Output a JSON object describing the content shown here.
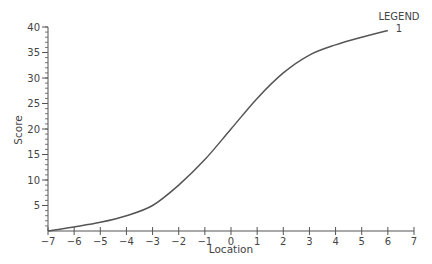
{
  "chart_data": {
    "type": "line",
    "title": "",
    "xlabel": "Location",
    "ylabel": "Score",
    "xlim": [
      -7,
      7
    ],
    "ylim": [
      0,
      40
    ],
    "xticks": [
      -7,
      -6,
      -5,
      -4,
      -3,
      -2,
      -1,
      0,
      1,
      2,
      3,
      4,
      5,
      6,
      7
    ],
    "yticks": [
      5,
      10,
      15,
      20,
      25,
      30,
      35,
      40
    ],
    "y_minor_step": 1,
    "grid": false,
    "legend": {
      "title": "LEGEND",
      "entries": [
        "1"
      ],
      "position": "top-right"
    },
    "series": [
      {
        "name": "1",
        "color": "#555555",
        "x": [
          -7,
          -6,
          -5,
          -4,
          -3,
          -2,
          -1,
          0,
          1,
          2,
          3,
          4,
          5,
          6
        ],
        "y": [
          0,
          0.8,
          1.7,
          3.0,
          5.0,
          9.0,
          14.0,
          20.0,
          26.0,
          31.0,
          34.5,
          36.5,
          38.0,
          39.3
        ]
      }
    ]
  },
  "colors": {
    "axis": "#555555",
    "line": "#555555",
    "text": "#444444"
  }
}
